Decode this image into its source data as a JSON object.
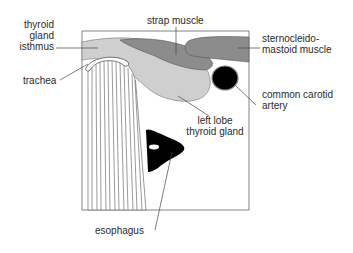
{
  "diagram": {
    "type": "anatomical cross-section",
    "labels": {
      "thyroid_isthmus": [
        "thyroid",
        "gland",
        "isthmus"
      ],
      "strap_muscle": "strap muscle",
      "scm": [
        "sternocleido-",
        "mastoid muscle"
      ],
      "trachea": "trachea",
      "carotid": [
        "common carotid",
        "artery"
      ],
      "left_lobe": [
        "left lobe",
        "thyroid gland"
      ],
      "esophagus": "esophagus"
    },
    "colors": {
      "thyroid": "#cfcfcf",
      "muscle": "#8c8c8c",
      "artery": "#000000",
      "esophagus": "#000000",
      "outline": "#555555"
    }
  }
}
